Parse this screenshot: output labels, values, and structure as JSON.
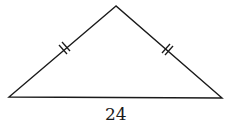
{
  "figure": {
    "type": "isosceles-triangle",
    "base_label": "24",
    "equal_sides_marked": true,
    "tick_marks_per_side": 2,
    "stroke_color": "#1a1a1a"
  }
}
